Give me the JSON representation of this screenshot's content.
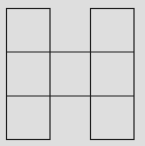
{
  "diagram": {
    "background_color": "#dedede",
    "line_color": "#1e1e1e",
    "cells": [
      {
        "row": 0,
        "col": 0
      },
      {
        "row": 0,
        "col": 2
      },
      {
        "row": 1,
        "col": 0
      },
      {
        "row": 1,
        "col": 1
      },
      {
        "row": 1,
        "col": 2
      },
      {
        "row": 2,
        "col": 0
      },
      {
        "row": 2,
        "col": 2
      }
    ]
  }
}
